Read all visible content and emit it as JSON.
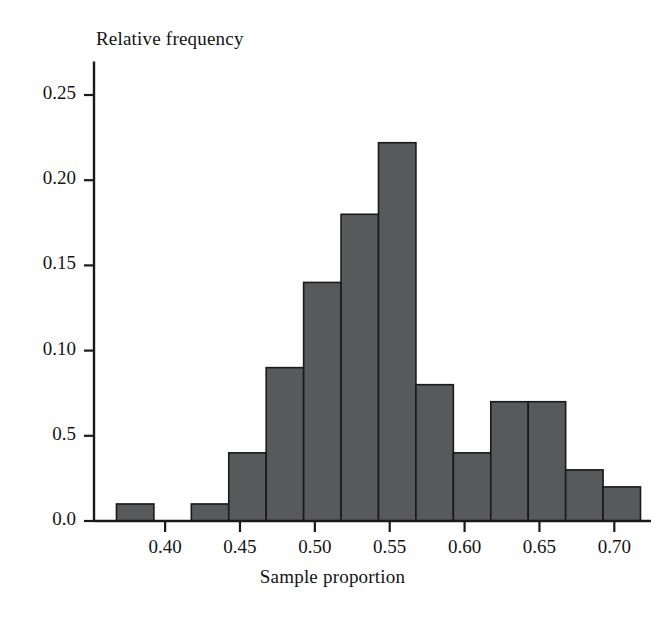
{
  "chart_data": {
    "type": "bar",
    "title": "",
    "subtitle": "",
    "xlabel": "Sample proportion",
    "ylabel": "Relative frequency",
    "grid": false,
    "legend": false,
    "legend_position": "none",
    "bar_color": "#58595b",
    "bar_edge_color": "#1a1a1a",
    "axis_color": "#1a1a1a",
    "background_color": "#ffffff",
    "xlim": [
      0.3525,
      0.7225
    ],
    "ylim": [
      0.0,
      0.265
    ],
    "x_tick_labels": [
      "0.40",
      "0.45",
      "0.50",
      "0.55",
      "0.60",
      "0.65",
      "0.70"
    ],
    "x_tick_values": [
      0.4,
      0.45,
      0.5,
      0.55,
      0.6,
      0.65,
      0.7
    ],
    "y_tick_labels": [
      "0.25",
      "0.20",
      "0.15",
      "0.10",
      "0.5",
      "0.0"
    ],
    "y_tick_values": [
      0.25,
      0.2,
      0.15,
      0.1,
      0.05,
      0.0
    ],
    "bin_width": 0.025,
    "bin_starts": [
      0.3675,
      0.3925,
      0.4175,
      0.4425,
      0.4675,
      0.4925,
      0.5175,
      0.5425,
      0.5675,
      0.5925,
      0.6175,
      0.6425,
      0.6675,
      0.6925
    ],
    "categories": [
      "0.3675-0.3925",
      "0.3925-0.4175",
      "0.4175-0.4425",
      "0.4425-0.4675",
      "0.4675-0.4925",
      "0.4925-0.5175",
      "0.5175-0.5425",
      "0.5425-0.5675",
      "0.5675-0.5925",
      "0.5925-0.6175",
      "0.6175-0.6425",
      "0.6425-0.6675",
      "0.6675-0.6925",
      "0.6925-0.7175"
    ],
    "values": [
      0.01,
      0.0,
      0.01,
      0.04,
      0.09,
      0.14,
      0.18,
      0.222,
      0.08,
      0.04,
      0.07,
      0.07,
      0.03,
      0.02
    ]
  }
}
